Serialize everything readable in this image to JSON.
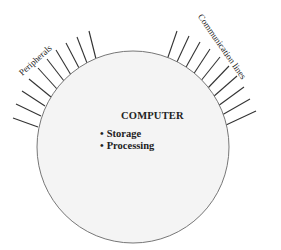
{
  "diagram": {
    "center_title": "COMPUTER",
    "bullets": [
      "Storage",
      "Processing"
    ],
    "left_label": "Peripherals",
    "right_label": "Communication lines",
    "left_line_count": 10,
    "right_line_count": 10,
    "colors": {
      "circle_fill": "#f4f4f4",
      "circle_stroke": "#777777",
      "line_stroke": "#333333",
      "text": "#222222"
    }
  }
}
